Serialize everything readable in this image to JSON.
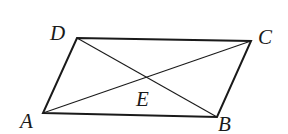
{
  "figure": {
    "type": "parallelogram-with-diagonals",
    "stroke_color": "#1a1a1a",
    "points": {
      "A": {
        "label": "A",
        "x": 43,
        "y": 113
      },
      "B": {
        "label": "B",
        "x": 217,
        "y": 117
      },
      "C": {
        "label": "C",
        "x": 251,
        "y": 41
      },
      "D": {
        "label": "D",
        "x": 77,
        "y": 38
      },
      "E": {
        "label": "E",
        "x": 147,
        "y": 78
      }
    },
    "labels": {
      "A": "A",
      "B": "B",
      "C": "C",
      "D": "D",
      "E": "E"
    },
    "segments": [
      "AB",
      "BC",
      "CD",
      "DA",
      "AC",
      "BD"
    ]
  }
}
